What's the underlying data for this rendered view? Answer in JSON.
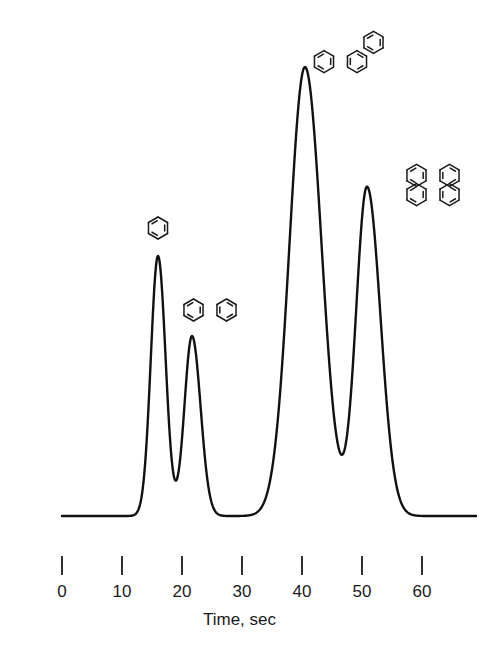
{
  "figure": {
    "background_color": "#ffffff",
    "line_color": "#111111"
  },
  "axes": {
    "y_label": "Recorder response",
    "x_label": "Time, sec",
    "x_ticks": [
      {
        "value": 0,
        "label": "0",
        "px": 62
      },
      {
        "value": 10,
        "label": "10",
        "px": 122
      },
      {
        "value": 20,
        "label": "20",
        "px": 182
      },
      {
        "value": 30,
        "label": "30",
        "px": 242
      },
      {
        "value": 40,
        "label": "40",
        "px": 302
      },
      {
        "value": 50,
        "label": "50",
        "px": 362
      },
      {
        "value": 60,
        "label": "60",
        "px": 422
      }
    ],
    "x_tick_top_px": 556,
    "x_tick_bottom_px": 575,
    "baseline_px": 516,
    "curve_start_px": 62,
    "curve_end_px": 476
  },
  "chart_data": {
    "type": "line",
    "title": "",
    "subtitle": "",
    "xlabel": "Time, sec",
    "ylabel": "Recorder response",
    "xlim": [
      0,
      69
    ],
    "ylim": [
      0,
      1
    ],
    "grid": false,
    "legend": "none",
    "annotations": [
      {
        "name": "benzene",
        "structure": "benzene",
        "rings": 1,
        "x_px": 158,
        "y_px": 228,
        "retention_time": 16
      },
      {
        "name": "naphthalene",
        "structure": "naphthalene",
        "rings": 2,
        "x_px": 210,
        "y_px": 310,
        "retention_time": 22
      },
      {
        "name": "phenanthrene",
        "structure": "phenanthrene",
        "rings": 3,
        "x_px": 357,
        "y_px": 52,
        "retention_time": 40.5
      },
      {
        "name": "pyrene",
        "structure": "pyrene",
        "rings": 4,
        "x_px": 433,
        "y_px": 185,
        "retention_time": 51
      }
    ],
    "peaks": [
      {
        "label": "benzene",
        "retention_time": 16.0,
        "apex_px_x": 158,
        "apex_px_y": 256,
        "height_rel": 1.0,
        "width_sec": 3.2
      },
      {
        "label": "naphthalene",
        "retention_time": 22.0,
        "apex_px_x": 192,
        "apex_px_y": 336,
        "height_rel": 0.82,
        "width_sec": 3.6
      },
      {
        "label": "phenanthrene",
        "retention_time": 40.5,
        "apex_px_x": 305,
        "apex_px_y": 67,
        "height_rel": 1.48,
        "width_sec": 6.0
      },
      {
        "label": "pyrene",
        "retention_time": 51.0,
        "apex_px_x": 367,
        "apex_px_y": 187,
        "height_rel": 1.17,
        "width_sec": 4.8
      }
    ],
    "series": [
      {
        "name": "detector-signal",
        "x": [
          0,
          16,
          22,
          40.5,
          51,
          69
        ],
        "values": [
          0,
          1.0,
          0.82,
          1.48,
          1.17,
          0
        ]
      }
    ]
  }
}
